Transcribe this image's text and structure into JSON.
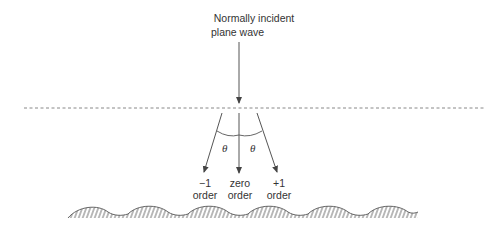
{
  "title": {
    "line1": "Normally incident",
    "line2": "plane wave"
  },
  "angle_label": "θ",
  "orders": [
    {
      "id": "minus-one",
      "line1": "−1",
      "line2": "order"
    },
    {
      "id": "zero",
      "line1": "zero",
      "line2": "order"
    },
    {
      "id": "plus-one",
      "line1": "+1",
      "line2": "order"
    }
  ],
  "colors": {
    "stroke": "#555555",
    "text": "#333333",
    "dashed": "#888888",
    "hatch": "#666666"
  }
}
